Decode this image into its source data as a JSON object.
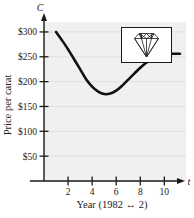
{
  "figure": {
    "name": "diamond-price-per-carat-graph",
    "background_color": "#ffffff",
    "plot_background_color": "#f0f0f0",
    "grid_color": "#d8d8d8",
    "axis_color": "#1a1a1a",
    "curve_color": "#111111"
  },
  "axes": {
    "y_variable_label": "C",
    "x_variable_label": "t",
    "y_axis_title": "Price per carat",
    "x_axis_caption": "Year (1982 ↔ 2)"
  },
  "inset": {
    "name": "diamond-illustration",
    "border_color": "#1a1a1a",
    "fill_color": "#ffffff"
  },
  "chart_data": {
    "type": "line",
    "title": "",
    "subtitle": "",
    "xlabel": "Year (1982 ↔ 2)",
    "ylabel": "Price per carat",
    "x_variable": "t",
    "y_variable": "C",
    "xlim": [
      0,
      11.8
    ],
    "ylim": [
      0,
      320
    ],
    "xticks": [
      2,
      4,
      6,
      8,
      10
    ],
    "xtick_labels": [
      "2",
      "4",
      "6",
      "8",
      "10"
    ],
    "yticks": [
      50,
      100,
      150,
      200,
      250,
      300
    ],
    "ytick_labels": [
      "$50",
      "$100",
      "$150",
      "$200",
      "$250",
      "$300"
    ],
    "grid": true,
    "grid_axis": "y",
    "legend": false,
    "legend_position": "none",
    "series": [
      {
        "name": "Price per carat",
        "x": [
          1.0,
          1.5,
          2.0,
          2.5,
          3.0,
          3.5,
          4.0,
          4.5,
          5.0,
          5.5,
          6.0,
          6.5,
          7.0,
          7.5,
          8.0,
          8.5,
          9.0,
          9.5,
          10.0,
          10.5,
          11.0,
          11.3
        ],
        "values": [
          300,
          283,
          265,
          245,
          225,
          205,
          190,
          180,
          175,
          176,
          182,
          192,
          204,
          216,
          228,
          238,
          246,
          251,
          254,
          256,
          256,
          256
        ]
      }
    ],
    "annotations": [
      {
        "name": "minimum-point",
        "x": 5.0,
        "y": 175,
        "text": ""
      }
    ]
  }
}
